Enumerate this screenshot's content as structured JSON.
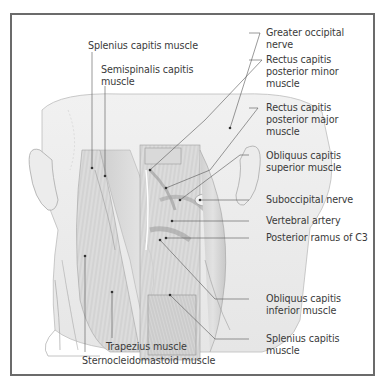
{
  "figure": {
    "type": "anatomical-illustration",
    "view": "posterior view of head and neck, suboccipital region",
    "border_color": "#6b6b6b",
    "line_color": "#555555",
    "text_color": "#3a3a3a"
  },
  "labels": {
    "left": {
      "splenius_capitis_top": "Splenius capitis muscle",
      "semispinalis": [
        "Semispinalis capitis",
        "muscle"
      ],
      "trapezius": "Trapezius muscle",
      "sternocleidomastoid": "Sternocleidomastoid muscle"
    },
    "right": {
      "greater_occipital": [
        "Greater occipital",
        "nerve"
      ],
      "rectus_minor": [
        "Rectus capitis",
        "posterior minor",
        "muscle"
      ],
      "rectus_major": [
        "Rectus capitis",
        "posterior major",
        "muscle"
      ],
      "obliquus_superior": [
        "Obliquus capitis",
        "superior muscle"
      ],
      "suboccipital_nerve": "Suboccipital nerve",
      "vertebral_artery": "Vertebral artery",
      "posterior_ramus": "Posterior ramus of C3",
      "obliquus_inferior": [
        "Obliquus capitis",
        "inferior muscle"
      ],
      "splenius_capitis_bottom": [
        "Splenius capitis",
        "muscle"
      ]
    }
  }
}
